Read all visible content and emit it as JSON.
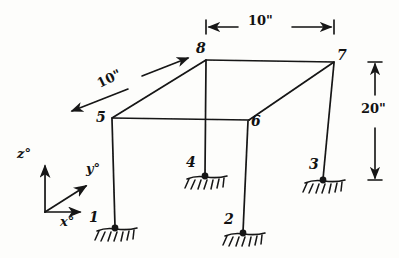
{
  "figure": {
    "ink_color": "#141414",
    "paper_color": "#fdfdfb"
  },
  "nodes": [
    {
      "id": "1",
      "label": "1",
      "x": 115,
      "y": 228,
      "label_x": 89,
      "label_y": 210,
      "supported": true,
      "kind": "base"
    },
    {
      "id": "2",
      "label": "2",
      "x": 243,
      "y": 233,
      "label_x": 224,
      "label_y": 212,
      "supported": true,
      "kind": "base"
    },
    {
      "id": "3",
      "label": "3",
      "x": 323,
      "y": 180,
      "label_x": 309,
      "label_y": 157,
      "supported": true,
      "kind": "base"
    },
    {
      "id": "4",
      "label": "4",
      "x": 205,
      "y": 176,
      "label_x": 186,
      "label_y": 155,
      "supported": true,
      "kind": "base"
    },
    {
      "id": "5",
      "label": "5",
      "x": 112,
      "y": 118,
      "label_x": 96,
      "label_y": 110,
      "supported": false,
      "kind": "roof"
    },
    {
      "id": "6",
      "label": "6",
      "x": 248,
      "y": 120,
      "label_x": 251,
      "label_y": 114,
      "supported": false,
      "kind": "roof"
    },
    {
      "id": "7",
      "label": "7",
      "x": 334,
      "y": 62,
      "label_x": 337,
      "label_y": 48,
      "supported": false,
      "kind": "roof"
    },
    {
      "id": "8",
      "label": "8",
      "x": 206,
      "y": 60,
      "label_x": 196,
      "label_y": 41,
      "supported": false,
      "kind": "roof"
    }
  ],
  "members": [
    {
      "name": "roof-5-6",
      "from": "5",
      "to": "6"
    },
    {
      "name": "roof-6-7",
      "from": "6",
      "to": "7"
    },
    {
      "name": "roof-7-8",
      "from": "7",
      "to": "8"
    },
    {
      "name": "roof-8-5",
      "from": "8",
      "to": "5"
    },
    {
      "name": "column-5-1",
      "from": "5",
      "to": "1"
    },
    {
      "name": "column-6-2",
      "from": "6",
      "to": "2"
    },
    {
      "name": "column-7-3",
      "from": "7",
      "to": "3"
    },
    {
      "name": "column-8-4",
      "from": "8",
      "to": "4"
    }
  ],
  "dimensions": {
    "top_width": {
      "label": "10\"",
      "label_x": 248,
      "label_y": 14,
      "line_y": 27,
      "x_start": 206,
      "x_end": 334
    },
    "diagonal_depth": {
      "label": "10\"",
      "label_x": 95,
      "label_y": 78,
      "rotation": -26,
      "arrow_a_x1": 128,
      "arrow_a_y1": 89,
      "arrow_a_x2": 70,
      "arrow_a_y2": 112,
      "arrow_b_x1": 142,
      "arrow_b_y1": 76,
      "arrow_b_x2": 190,
      "arrow_b_y2": 57
    },
    "height": {
      "label": "20\"",
      "label_x": 361,
      "label_y": 109,
      "line_x": 375,
      "y_top": 62,
      "y_bottom": 180
    }
  },
  "axes": {
    "origin_x": 45,
    "origin_y": 212,
    "items": [
      {
        "name": "z-axis",
        "label": "z°",
        "label_x": 17,
        "label_y": 147,
        "tip_x": 45,
        "tip_y": 162
      },
      {
        "name": "y-axis",
        "label": "y°",
        "label_x": 86,
        "label_y": 162,
        "tip_x": 83,
        "tip_y": 183
      },
      {
        "name": "x-axis",
        "label": "x°",
        "label_x": 60,
        "label_y": 219,
        "tip_x": 76,
        "tip_y": 212
      }
    ]
  }
}
